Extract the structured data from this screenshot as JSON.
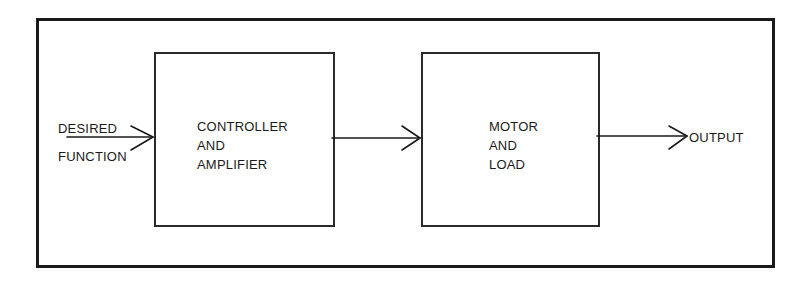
{
  "diagram": {
    "type": "block-diagram",
    "title": "",
    "input": {
      "label_line1": "DESIRED",
      "label_line2": "FUNCTION"
    },
    "blocks": [
      {
        "id": "controller",
        "lines": [
          "CONTROLLER",
          "AND",
          "AMPLIFIER"
        ]
      },
      {
        "id": "motor",
        "lines": [
          "MOTOR",
          "AND",
          "LOAD"
        ]
      }
    ],
    "output": {
      "label": "OUTPUT"
    },
    "connections": [
      {
        "from": "input",
        "to": "controller"
      },
      {
        "from": "controller",
        "to": "motor"
      },
      {
        "from": "motor",
        "to": "output"
      }
    ],
    "colors": {
      "line": "#1a1a1a",
      "background": "#ffffff"
    }
  }
}
